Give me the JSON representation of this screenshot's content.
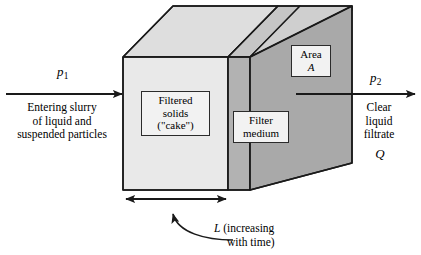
{
  "figure": {
    "type": "cake-filtration-schematic",
    "background_color": "#ffffff",
    "line_color": "#1a1a1a"
  },
  "solid": {
    "cake_face_color": "#e9e9e9",
    "cake_top_color": "#dedede",
    "medium_front_color": "#b2b2b2",
    "medium_top_color": "#c6c6c6",
    "side_face_color": "#a9a9a9"
  },
  "callouts": {
    "cake": {
      "name": "filtered-solids-cake",
      "line1": "Filtered",
      "line2": "solids",
      "line3": "(\"cake\")"
    },
    "medium": {
      "name": "filter-medium",
      "line1": "Filter",
      "line2": "medium"
    },
    "area": {
      "name": "area-a",
      "line1": "Area",
      "line2": "A"
    }
  },
  "inlet": {
    "pressure_symbol": "p",
    "pressure_subscript": "1",
    "line1": "Entering slurry",
    "line2": "of liquid and",
    "line3": "suspended particles"
  },
  "outlet": {
    "pressure_symbol": "p",
    "pressure_subscript": "2",
    "line1": "Clear",
    "line2": "liquid",
    "line3": "filtrate",
    "flow_symbol": "Q"
  },
  "dimension": {
    "symbol": "L",
    "line1": "(increasing",
    "line2": "with time)"
  }
}
